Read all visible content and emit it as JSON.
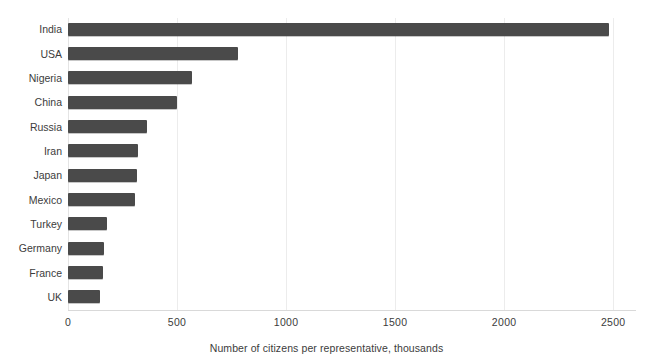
{
  "chart_data": {
    "type": "bar",
    "orientation": "horizontal",
    "title": "",
    "xlabel": "Number of citizens per representative, thousands",
    "ylabel": "",
    "categories": [
      "India",
      "USA",
      "Nigeria",
      "China",
      "Russia",
      "Iran",
      "Japan",
      "Mexico",
      "Turkey",
      "Germany",
      "France",
      "UK"
    ],
    "values": [
      2480,
      780,
      570,
      500,
      360,
      320,
      315,
      305,
      180,
      165,
      160,
      145
    ],
    "xlim": [
      0,
      2600
    ],
    "xticks": [
      0,
      500,
      1000,
      1500,
      2000,
      2500
    ],
    "xtick_labels": [
      "0",
      "500",
      "1000",
      "1500",
      "2000",
      "2500"
    ],
    "grid": "vertical",
    "legend": "none",
    "bar_color": "#4a4a4a",
    "gridline_color": "#ececec",
    "background_color": "#ffffff"
  },
  "top_clipped_text": "",
  "axis": {
    "x_title": "Number of citizens per representative, thousands"
  }
}
